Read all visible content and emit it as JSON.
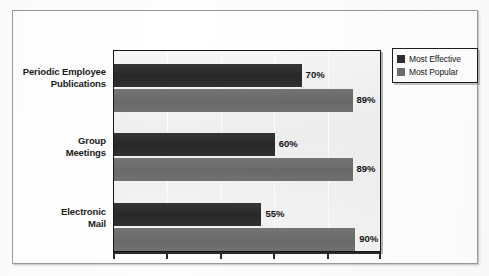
{
  "chart_data": {
    "type": "bar",
    "orientation": "horizontal",
    "title": "",
    "subtitle": "",
    "xlabel": "",
    "ylabel": "",
    "xlim": [
      0,
      100
    ],
    "grid": true,
    "grid_axis": "x",
    "legend_position": "top-right",
    "value_label_suffix": "%",
    "categories": [
      "Periodic Employee Publications",
      "Group Meetings",
      "Electronic Mail"
    ],
    "category_lines": [
      [
        "Periodic Employee",
        "Publications"
      ],
      [
        "Group",
        "Meetings"
      ],
      [
        "Electronic",
        "Mail"
      ]
    ],
    "series": [
      {
        "name": "Most Effective",
        "color": "#2e2e2e",
        "values": [
          70,
          60,
          55
        ],
        "labels": [
          "70%",
          "60%",
          "55%"
        ]
      },
      {
        "name": "Most Popular",
        "color": "#6d6d6d",
        "values": [
          89,
          89,
          90
        ],
        "labels": [
          "89%",
          "89%",
          "90%"
        ]
      }
    ],
    "x_ticks": [
      0,
      20,
      40,
      60,
      80,
      100
    ]
  },
  "legend": {
    "items": [
      {
        "label": "Most Effective",
        "color": "#2e2e2e",
        "swatch": "legend-swatch-effective"
      },
      {
        "label": "Most Popular",
        "color": "#6d6d6d",
        "swatch": "legend-swatch-popular"
      }
    ]
  },
  "colors": {
    "series_effective": "#2e2e2e",
    "series_popular": "#6d6d6d",
    "plot_background": "#f2f2f2",
    "plot_border": "#151515",
    "page_background": "#ffffff",
    "page_border": "#9a9a9a",
    "label_text": "#1a1a1a"
  }
}
